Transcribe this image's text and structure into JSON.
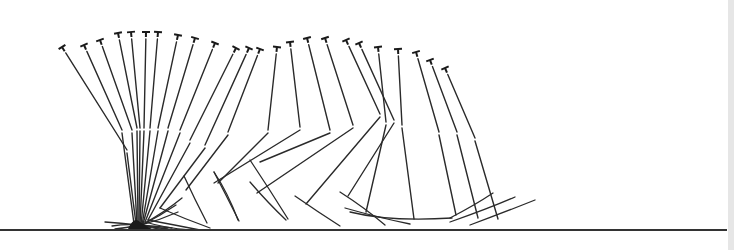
{
  "diagram": {
    "type": "motion-sequence-stick-diagram",
    "ground": {
      "x1": 0,
      "x2": 727,
      "y": 230
    },
    "frames": [
      {
        "hip": [
          62,
          47
        ],
        "knee": [
          127,
          150
        ],
        "ankle": [
          136,
          224
        ],
        "foot": [
          [
            136,
            224
          ],
          [
            150,
            228
          ],
          [
            165,
            230
          ]
        ]
      },
      {
        "hip": [
          84,
          45
        ],
        "knee": [
          122,
          130
        ],
        "ankle": [
          134,
          224
        ],
        "foot": [
          [
            134,
            224
          ],
          [
            150,
            227
          ],
          [
            168,
            229
          ]
        ]
      },
      {
        "hip": [
          100,
          40
        ],
        "knee": [
          132,
          130
        ],
        "ankle": [
          137,
          225
        ],
        "foot": [
          [
            137,
            225
          ],
          [
            155,
            226
          ],
          [
            172,
            228
          ]
        ]
      },
      {
        "hip": [
          118,
          33
        ],
        "knee": [
          137,
          128
        ],
        "ankle": [
          138,
          225
        ],
        "foot": [
          [
            138,
            225
          ],
          [
            120,
            223
          ],
          [
            105,
            222
          ]
        ]
      },
      {
        "hip": [
          131,
          32
        ],
        "knee": [
          140,
          128
        ],
        "ankle": [
          139,
          225
        ],
        "foot": [
          [
            139,
            225
          ],
          [
            125,
            224
          ],
          [
            112,
            226
          ]
        ]
      },
      {
        "hip": [
          146,
          32
        ],
        "knee": [
          144,
          128
        ],
        "ankle": [
          140,
          225
        ],
        "foot": [
          [
            140,
            225
          ],
          [
            125,
            228
          ],
          [
            115,
            229
          ]
        ]
      },
      {
        "hip": [
          158,
          32
        ],
        "knee": [
          150,
          128
        ],
        "ankle": [
          141,
          225
        ],
        "foot": [
          [
            141,
            225
          ],
          [
            160,
            220
          ],
          [
            178,
            212
          ]
        ]
      },
      {
        "hip": [
          178,
          35
        ],
        "knee": [
          158,
          128
        ],
        "ankle": [
          142,
          225
        ],
        "foot": [
          [
            142,
            225
          ],
          [
            160,
            216
          ],
          [
            176,
            205
          ]
        ]
      },
      {
        "hip": [
          195,
          38
        ],
        "knee": [
          168,
          128
        ],
        "ankle": [
          143,
          224
        ],
        "foot": [
          [
            143,
            224
          ],
          [
            165,
            212
          ],
          [
            182,
            198
          ]
        ]
      },
      {
        "hip": [
          215,
          43
        ],
        "knee": [
          180,
          130
        ],
        "ankle": [
          145,
          222
        ],
        "foot": [
          [
            145,
            222
          ],
          [
            165,
            228
          ],
          [
            190,
            230
          ]
        ]
      },
      {
        "hip": [
          236,
          48
        ],
        "knee": [
          190,
          140
        ],
        "ankle": [
          148,
          220
        ],
        "foot": [
          [
            148,
            220
          ],
          [
            175,
            225
          ],
          [
            200,
            230
          ]
        ]
      },
      {
        "hip": [
          249,
          48
        ],
        "knee": [
          205,
          145
        ],
        "ankle": [
          160,
          208
        ],
        "foot": [
          [
            160,
            208
          ],
          [
            185,
            219
          ],
          [
            210,
            228
          ]
        ]
      },
      {
        "hip": [
          260,
          49
        ],
        "knee": [
          228,
          132
        ],
        "ankle": [
          186,
          190
        ],
        "foot": [
          [
            184,
            176
          ],
          [
            195,
            200
          ],
          [
            207,
            223
          ]
        ]
      },
      {
        "hip": [
          277,
          47
        ],
        "knee": [
          268,
          130
        ],
        "ankle": [
          218,
          183
        ],
        "foot": [
          [
            214,
            172
          ],
          [
            228,
            193
          ],
          [
            238,
            220
          ]
        ]
      },
      {
        "hip": [
          290,
          42
        ],
        "knee": [
          300,
          127
        ],
        "ankle": [
          214,
          183
        ],
        "foot": [
          [
            214,
            172
          ],
          [
            226,
            195
          ],
          [
            239,
            221
          ]
        ]
      },
      {
        "hip": [
          307,
          38
        ],
        "knee": [
          330,
          130
        ],
        "ankle": [
          260,
          162
        ],
        "foot": [
          [
            250,
            160
          ],
          [
            270,
            190
          ],
          [
            288,
            219
          ]
        ]
      },
      {
        "hip": [
          325,
          38
        ],
        "knee": [
          353,
          125
        ],
        "ankle": [
          257,
          193
        ],
        "foot": [
          [
            250,
            182
          ],
          [
            268,
            203
          ],
          [
            286,
            220
          ]
        ]
      },
      {
        "hip": [
          346,
          40
        ],
        "knee": [
          380,
          114
        ],
        "ankle": [
          306,
          204
        ],
        "foot": [
          [
            295,
            196
          ],
          [
            318,
            212
          ],
          [
            340,
            226
          ]
        ]
      },
      {
        "hip": [
          359,
          43
        ],
        "knee": [
          394,
          120
        ],
        "ankle": [
          348,
          196
        ],
        "foot": [
          [
            340,
            192
          ],
          [
            365,
            208
          ],
          [
            385,
            225
          ]
        ]
      },
      {
        "hip": [
          378,
          47
        ],
        "knee": [
          386,
          122
        ],
        "ankle": [
          366,
          212
        ],
        "foot": [
          [
            345,
            208
          ],
          [
            380,
            218
          ],
          [
            410,
            224
          ]
        ]
      },
      {
        "hip": [
          398,
          49
        ],
        "knee": [
          402,
          125
        ],
        "ankle": [
          414,
          219
        ],
        "foot": [
          [
            350,
            212
          ],
          [
            390,
            222
          ],
          [
            452,
            218
          ]
        ]
      },
      {
        "hip": [
          416,
          52
        ],
        "knee": [
          439,
          132
        ],
        "ankle": [
          456,
          215
        ],
        "foot": [
          [
            450,
            218
          ],
          [
            475,
            205
          ],
          [
            493,
            193
          ]
        ]
      },
      {
        "hip": [
          430,
          60
        ],
        "knee": [
          457,
          132
        ],
        "ankle": [
          478,
          218
        ],
        "foot": [
          [
            450,
            222
          ],
          [
            490,
            208
          ],
          [
            515,
            197
          ]
        ]
      },
      {
        "hip": [
          445,
          68
        ],
        "knee": [
          475,
          138
        ],
        "ankle": [
          498,
          219
        ],
        "foot": [
          [
            470,
            225
          ],
          [
            505,
            212
          ],
          [
            535,
            200
          ]
        ]
      }
    ],
    "colors": {
      "line": "#2a2a2a",
      "background": "#ffffff",
      "ground": "#333333"
    }
  }
}
